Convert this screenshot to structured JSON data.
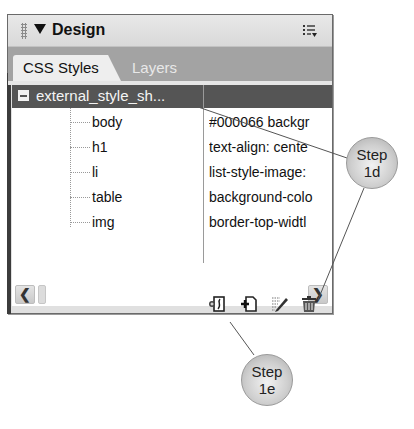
{
  "panel": {
    "title": "Design",
    "collapse_icon": "triangle-down-icon",
    "options_icon": "panel-options-icon",
    "tabs": [
      {
        "label": "CSS Styles",
        "active": true
      },
      {
        "label": "Layers",
        "active": false
      }
    ]
  },
  "tree": {
    "root": {
      "label": "external_style_sh...",
      "expanded": true,
      "expander_icon": "minus-box-icon"
    },
    "rules": [
      {
        "selector": "body",
        "properties": "#000066 backgr"
      },
      {
        "selector": "h1",
        "properties": "text-align: cente"
      },
      {
        "selector": "li",
        "properties": "list-style-image:"
      },
      {
        "selector": "table",
        "properties": "background-colo"
      },
      {
        "selector": "img",
        "properties": "border-top-widtl"
      }
    ]
  },
  "scrollbar": {
    "left_glyph": "❮",
    "right_glyph": "❯"
  },
  "footer_buttons": [
    {
      "name": "attach-style-sheet",
      "icon": "attach-stylesheet-icon"
    },
    {
      "name": "new-css-rule",
      "icon": "new-css-rule-icon"
    },
    {
      "name": "edit-style",
      "icon": "edit-style-icon"
    },
    {
      "name": "delete-css-rule",
      "icon": "trash-icon"
    }
  ],
  "callouts": [
    {
      "id": "step-1d",
      "line1": "Step",
      "line2": "1d"
    },
    {
      "id": "step-1e",
      "line1": "Step",
      "line2": "1e"
    }
  ],
  "colors": {
    "header_bg": "#e0e0e0",
    "tab_strip_bg": "#a3a3a3",
    "selected_row_bg": "#555555",
    "bubble_fill": "#cfcfcf"
  }
}
